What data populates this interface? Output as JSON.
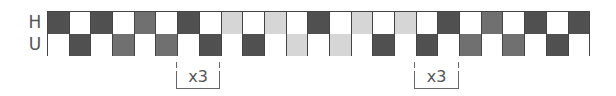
{
  "diagram": {
    "rows": [
      {
        "label": "H",
        "cells": [
          "D",
          "W",
          "D",
          "W",
          "M",
          "W",
          "D",
          "W",
          "L",
          "W",
          "L",
          "W",
          "D",
          "W",
          "L",
          "W",
          "L",
          "W",
          "D",
          "W",
          "M",
          "W",
          "D",
          "W",
          "D"
        ]
      },
      {
        "label": "U",
        "cells": [
          "W",
          "D",
          "W",
          "M",
          "W",
          "M",
          "W",
          "D",
          "W",
          "D",
          "W",
          "L",
          "W",
          "L",
          "W",
          "D",
          "W",
          "D",
          "W",
          "M",
          "W",
          "M",
          "W",
          "D",
          "W"
        ]
      }
    ],
    "colors": {
      "D": "#505050",
      "M": "#707070",
      "L": "#d6d6d6",
      "W": "#ffffff"
    },
    "brackets": [
      {
        "label": "x3",
        "left": 176,
        "width": 44
      },
      {
        "label": "x3",
        "left": 414,
        "width": 45
      }
    ]
  }
}
